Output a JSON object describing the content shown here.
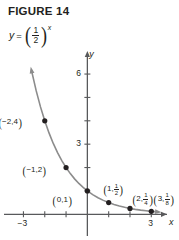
{
  "figure": {
    "title": "FIGURE 14",
    "equation": {
      "variable": "y",
      "equals": "=",
      "base_numerator": "1",
      "base_denominator": "2",
      "exponent": "x",
      "plain": "y = (1/2)^x"
    }
  },
  "chart_data": {
    "type": "line",
    "title": "FIGURE 14",
    "function_label": "y = (1/2)^x",
    "xlabel": "x",
    "ylabel": "y",
    "xlim": [
      -4.1,
      4.3
    ],
    "ylim": [
      -1.1,
      7.2
    ],
    "xticks": [
      -3,
      -2,
      -1,
      1,
      2,
      3
    ],
    "yticks": [
      1,
      2,
      3,
      4,
      5,
      6
    ],
    "xtick_labels": [
      {
        "value": -3,
        "label": "-3"
      },
      {
        "value": 3,
        "label": "3"
      }
    ],
    "ytick_labels": [
      {
        "value": 3,
        "label": "3"
      },
      {
        "value": 6,
        "label": "6"
      }
    ],
    "grid": false,
    "legend": false,
    "curve_color": "#8c8c8c",
    "axis_color": "#58595b",
    "point_color": "#231f20",
    "points": [
      {
        "x": -2,
        "y": 4,
        "label": "(-2, 4)",
        "x_text": "-2",
        "y_text": "4",
        "y_is_fraction": false
      },
      {
        "x": -1,
        "y": 2,
        "label": "(-1, 2)",
        "x_text": "-1",
        "y_text": "2",
        "y_is_fraction": false
      },
      {
        "x": 0,
        "y": 1,
        "label": "(0, 1)",
        "x_text": "0",
        "y_text": "1",
        "y_is_fraction": false
      },
      {
        "x": 1,
        "y": 0.5,
        "label": "(1, 1/2)",
        "x_text": "1",
        "y_num": "1",
        "y_den": "2",
        "y_is_fraction": true
      },
      {
        "x": 2,
        "y": 0.25,
        "label": "(2, 1/4)",
        "x_text": "2",
        "y_num": "1",
        "y_den": "4",
        "y_is_fraction": true
      },
      {
        "x": 3,
        "y": 0.125,
        "label": "(3, 1/8)",
        "x_text": "3",
        "y_num": "1",
        "y_den": "8",
        "y_is_fraction": true
      }
    ],
    "curve_samples_x": [
      -2.62,
      -2.4,
      -2.2,
      -2.0,
      -1.8,
      -1.6,
      -1.4,
      -1.2,
      -1.0,
      -0.8,
      -0.6,
      -0.4,
      -0.2,
      0.0,
      0.25,
      0.5,
      0.75,
      1.0,
      1.25,
      1.5,
      1.75,
      2.0,
      2.25,
      2.5,
      2.75,
      3.0,
      3.3
    ],
    "arrow_head_start": true,
    "arrow_head_end": true
  },
  "axis_labels": {
    "x_name": "x",
    "y_name": "y",
    "x_neg3": "-3",
    "x_pos3": "3",
    "y_3": "3",
    "y_6": "6"
  }
}
